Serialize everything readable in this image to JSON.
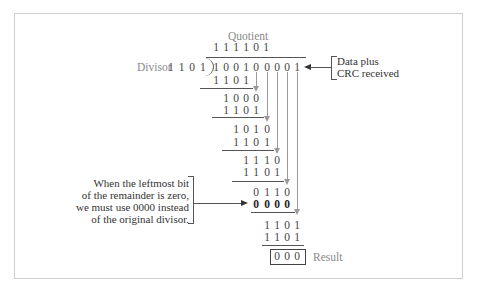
{
  "labels": {
    "quotient": "Quotient",
    "divisor": "Divisor",
    "divisor_value": "1 1 0 1",
    "data_plus_crc_line1": "Data plus",
    "data_plus_crc_line2": "CRC received",
    "result": "Result"
  },
  "quotient_digits": [
    "1",
    "1",
    "1",
    "1",
    "0",
    "1"
  ],
  "dividend_digits": [
    "1",
    "0",
    "0",
    "1",
    "0",
    "0",
    "0",
    "0",
    "1"
  ],
  "steps": [
    {
      "digits": [
        "1",
        "1",
        "0",
        "1"
      ],
      "start_col": 0,
      "bold": false
    },
    {
      "digits": [
        "1",
        "0",
        "0",
        "0"
      ],
      "start_col": 1,
      "bold": false
    },
    {
      "digits": [
        "1",
        "1",
        "0",
        "1"
      ],
      "start_col": 1,
      "bold": false
    },
    {
      "digits": [
        "1",
        "0",
        "1",
        "0"
      ],
      "start_col": 2,
      "bold": false
    },
    {
      "digits": [
        "1",
        "1",
        "0",
        "1"
      ],
      "start_col": 2,
      "bold": false
    },
    {
      "digits": [
        "1",
        "1",
        "1",
        "0"
      ],
      "start_col": 3,
      "bold": false
    },
    {
      "digits": [
        "1",
        "1",
        "0",
        "1"
      ],
      "start_col": 3,
      "bold": false
    },
    {
      "digits": [
        "0",
        "1",
        "1",
        "0"
      ],
      "start_col": 4,
      "bold": false
    },
    {
      "digits": [
        "0",
        "0",
        "0",
        "0"
      ],
      "start_col": 4,
      "bold": true
    },
    {
      "digits": [
        "1",
        "1",
        "0",
        "1"
      ],
      "start_col": 5,
      "bold": false
    },
    {
      "digits": [
        "1",
        "1",
        "0",
        "1"
      ],
      "start_col": 5,
      "bold": false
    }
  ],
  "result_digits": [
    "0",
    "0",
    "0"
  ],
  "note": {
    "line1": "When the leftmost bit",
    "line2": "of the remainder is zero,",
    "line3": "we must use 0000 instead",
    "line4": "of the original divisor."
  },
  "colors": {
    "text": "#444444",
    "label_gray": "#8a8a8a",
    "arrow_gray": "#9a9a9a",
    "frame": "#cfcfcf"
  }
}
